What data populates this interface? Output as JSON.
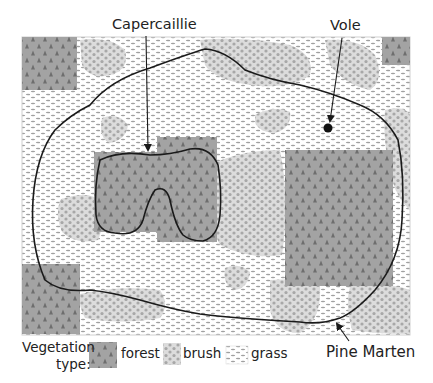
{
  "labels": {
    "capercaillie": "Capercaillie",
    "vole": "Vole",
    "pine_marten": "Pine Marten"
  },
  "legend": {
    "title_line1": "Vegetation",
    "title_line2": "type:",
    "items": [
      {
        "key": "forest",
        "label": "forest"
      },
      {
        "key": "brush",
        "label": "brush"
      },
      {
        "key": "grass",
        "label": "grass"
      }
    ]
  },
  "colors": {
    "forest_fill": "#a3a3a3",
    "forest_tree": "#6e6e6e",
    "brush_fill": "#dcdcdc",
    "brush_dot": "#a6a6a6",
    "grass_fill": "#ffffff",
    "grass_dash": "#9a9a9a",
    "outline": "#1a1a1a"
  },
  "regions": {
    "forest": [
      {
        "x": 22,
        "y": 37,
        "w": 55,
        "h": 53
      },
      {
        "x": 382,
        "y": 37,
        "w": 28,
        "h": 28
      },
      {
        "x": 157,
        "y": 137,
        "w": 60,
        "h": 105
      },
      {
        "x": 94,
        "y": 152,
        "w": 70,
        "h": 80
      },
      {
        "x": 285,
        "y": 150,
        "w": 108,
        "h": 136
      },
      {
        "x": 22,
        "y": 264,
        "w": 58,
        "h": 70
      }
    ]
  },
  "ranges": {
    "pine_marten": "large closed home range loop",
    "capercaillie": "small U-shaped home range within forest"
  }
}
